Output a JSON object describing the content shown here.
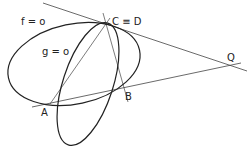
{
  "diagram": {
    "curves": [
      {
        "name": "f",
        "label": "f = o"
      },
      {
        "name": "g",
        "label": "g = o"
      }
    ],
    "points": {
      "A": {
        "label": "A"
      },
      "B": {
        "label": "B"
      },
      "CD": {
        "label": "C ≡ D"
      },
      "Q": {
        "label": "Q"
      }
    },
    "colors": {
      "stroke": "#222222",
      "line": "#444444",
      "background": "#ffffff"
    }
  }
}
